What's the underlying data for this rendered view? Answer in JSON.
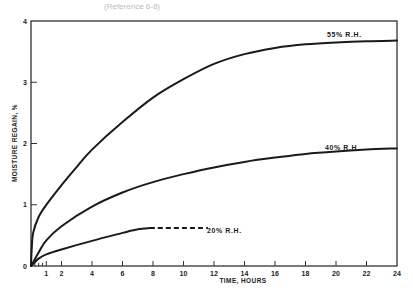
{
  "caption": "(Reference 6-8)",
  "chart_data": {
    "type": "line",
    "title": "",
    "xlabel": "TIME, HOURS",
    "ylabel": "MOISTURE REGAIN, %",
    "xlim": [
      0,
      24
    ],
    "ylim": [
      0,
      4
    ],
    "x_ticks": [
      1,
      2,
      4,
      6,
      8,
      10,
      12,
      14,
      16,
      18,
      20,
      22,
      24
    ],
    "x_minor_ticks": [
      0.25,
      0.5,
      0.75
    ],
    "y_ticks": [
      0,
      1,
      2,
      3,
      4
    ],
    "grid": false,
    "legend": "inline-labels",
    "series": [
      {
        "name": "55% R.H.",
        "label": "55% R.H.",
        "style": "solid",
        "x": [
          0,
          0.05,
          0.15,
          0.5,
          1,
          2,
          3,
          4,
          6,
          8,
          10,
          12,
          14,
          16,
          18,
          20,
          22,
          24
        ],
        "y": [
          0,
          0.3,
          0.55,
          0.8,
          1.0,
          1.32,
          1.62,
          1.9,
          2.35,
          2.75,
          3.05,
          3.3,
          3.46,
          3.56,
          3.62,
          3.65,
          3.67,
          3.68
        ]
      },
      {
        "name": "40% R.H.",
        "label": "40% R.H.",
        "style": "solid",
        "x": [
          0,
          0.5,
          1,
          2,
          4,
          6,
          8,
          10,
          12,
          14,
          16,
          18,
          20,
          22,
          24
        ],
        "y": [
          0,
          0.22,
          0.42,
          0.65,
          0.97,
          1.2,
          1.37,
          1.5,
          1.61,
          1.7,
          1.77,
          1.83,
          1.87,
          1.9,
          1.92
        ]
      },
      {
        "name": "20% R.H.",
        "label": "20% R.H.",
        "style": "solid",
        "x": [
          0,
          0.5,
          1,
          2,
          4,
          6,
          7,
          7.8
        ],
        "y": [
          0,
          0.12,
          0.19,
          0.27,
          0.41,
          0.54,
          0.6,
          0.62
        ]
      },
      {
        "name": "20% R.H. (extrapolated)",
        "label": "",
        "style": "dashed",
        "x": [
          7.8,
          11.6
        ],
        "y": [
          0.62,
          0.62
        ]
      }
    ]
  }
}
